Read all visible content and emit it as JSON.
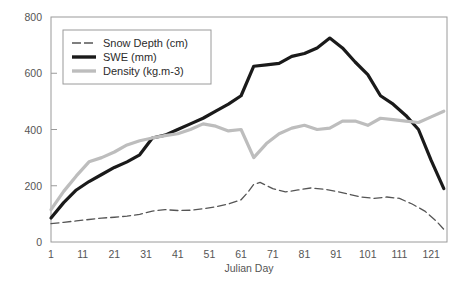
{
  "chart_data": {
    "type": "line",
    "title": "",
    "xlabel": "Julian Day",
    "ylabel": "",
    "xlim": [
      1,
      126
    ],
    "ylim": [
      0,
      800
    ],
    "grid": false,
    "legend_position": "upper-left",
    "xticks": [
      "1",
      "11",
      "21",
      "31",
      "41",
      "51",
      "61",
      "71",
      "81",
      "91",
      "101",
      "111",
      "121"
    ],
    "xtick_values": [
      1,
      11,
      21,
      31,
      41,
      51,
      61,
      71,
      81,
      91,
      101,
      111,
      121
    ],
    "yticks": [
      "0",
      "200",
      "400",
      "600",
      "800"
    ],
    "ytick_values": [
      0,
      200,
      400,
      600,
      800
    ],
    "series": [
      {
        "name": "Snow Depth (cm)",
        "style": "dashed",
        "color": "#555555",
        "width": 1.3,
        "x": [
          1,
          5,
          9,
          13,
          17,
          21,
          25,
          29,
          33,
          37,
          41,
          45,
          49,
          53,
          57,
          61,
          63,
          65,
          67,
          71,
          75,
          79,
          83,
          87,
          91,
          95,
          99,
          103,
          107,
          111,
          115,
          119,
          123,
          125
        ],
        "values": [
          65,
          70,
          75,
          80,
          85,
          88,
          92,
          98,
          110,
          115,
          112,
          113,
          118,
          125,
          135,
          150,
          175,
          205,
          212,
          190,
          178,
          185,
          192,
          188,
          180,
          170,
          160,
          155,
          160,
          155,
          135,
          110,
          70,
          45
        ]
      },
      {
        "name": "SWE (mm)",
        "style": "solid",
        "color": "#1a1a1a",
        "width": 3.2,
        "x": [
          1,
          5,
          9,
          13,
          17,
          21,
          25,
          29,
          33,
          37,
          41,
          45,
          49,
          53,
          57,
          61,
          65,
          69,
          73,
          77,
          81,
          85,
          89,
          93,
          97,
          101,
          105,
          109,
          113,
          117,
          121,
          125
        ],
        "values": [
          85,
          140,
          185,
          215,
          240,
          265,
          285,
          310,
          370,
          380,
          400,
          420,
          440,
          465,
          490,
          520,
          625,
          630,
          635,
          660,
          670,
          690,
          725,
          690,
          640,
          595,
          520,
          490,
          450,
          400,
          290,
          190
        ]
      },
      {
        "name": "Density (kg.m-3)",
        "style": "solid",
        "color": "#bdbdbd",
        "width": 3.2,
        "x": [
          1,
          5,
          9,
          13,
          17,
          21,
          25,
          29,
          33,
          37,
          41,
          45,
          49,
          53,
          57,
          61,
          65,
          69,
          73,
          77,
          81,
          85,
          89,
          93,
          97,
          101,
          105,
          109,
          113,
          117,
          121,
          125
        ],
        "values": [
          115,
          180,
          235,
          285,
          300,
          320,
          345,
          360,
          370,
          378,
          385,
          400,
          420,
          412,
          395,
          400,
          300,
          350,
          385,
          405,
          415,
          400,
          405,
          430,
          430,
          415,
          440,
          435,
          430,
          425,
          445,
          465
        ]
      }
    ]
  },
  "legend": {
    "entries": [
      {
        "label": "Snow Depth (cm)"
      },
      {
        "label": "SWE (mm)"
      },
      {
        "label": "Density (kg.m-3)"
      }
    ]
  }
}
